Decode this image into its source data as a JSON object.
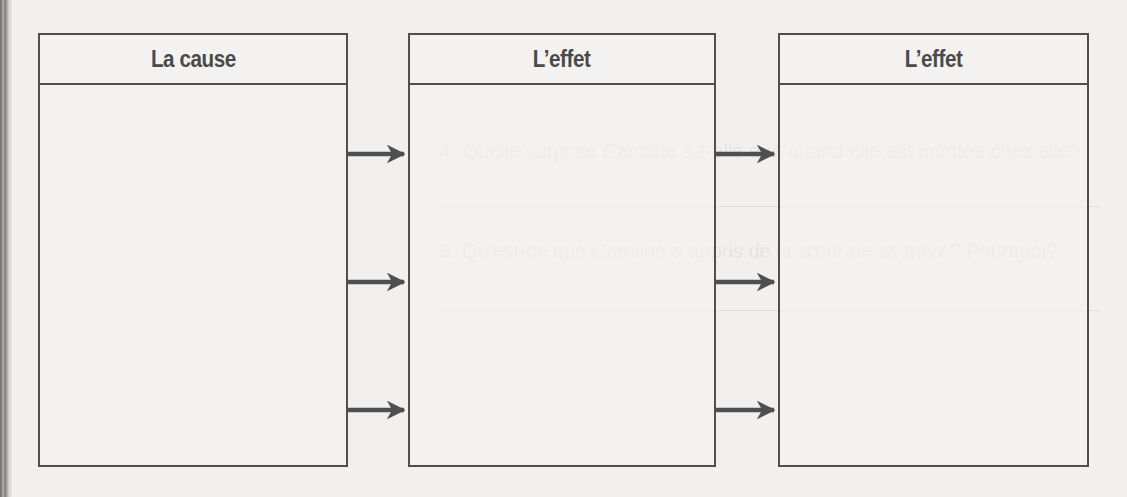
{
  "diagram": {
    "type": "cause-effect-chain",
    "boxes": [
      {
        "title": "La cause",
        "content": ""
      },
      {
        "title": "L’effet",
        "content": ""
      },
      {
        "title": "L’effet",
        "content": ""
      }
    ],
    "connections": [
      {
        "from": 0,
        "to": 1,
        "count": 3
      },
      {
        "from": 1,
        "to": 2,
        "count": 3
      }
    ]
  },
  "background_text": {
    "lines": [
      "4. Quelle surprise Caroline a-t-elle eue quand elle est montée chez elle?",
      "5. Qu'est-ce que Caroline a appris de la sœur de sa mère? Pourquoi?"
    ]
  },
  "colors": {
    "stroke": "#4f4f4f",
    "title": "#4a4a4a",
    "paper": "#f1f0ee"
  }
}
